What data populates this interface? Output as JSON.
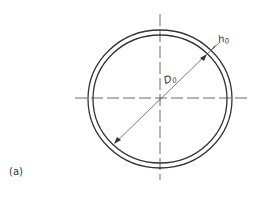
{
  "figure": {
    "panel_label": "(a)",
    "labels": {
      "wall_thickness": {
        "symbol": "h",
        "subscript": "0"
      },
      "diameter": {
        "symbol": "D",
        "subscript": "0"
      }
    },
    "colors": {
      "line": "#333333",
      "background": "#ffffff"
    },
    "geometry": {
      "center": [
        160,
        98
      ],
      "outer_radius": [
        72,
        69
      ],
      "inner_radius": [
        67,
        64
      ]
    }
  }
}
